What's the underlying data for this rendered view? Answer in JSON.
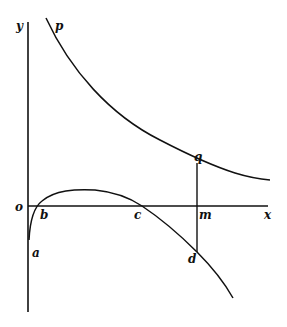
{
  "diagram": {
    "labels": {
      "y_axis": "y",
      "x_axis": "x",
      "origin": "o",
      "curve_upper": "p",
      "point_q": "q",
      "point_m": "m",
      "point_a": "a",
      "point_b": "b",
      "point_c": "c",
      "point_d": "d"
    },
    "colors": {
      "ink": "#111111",
      "background": "#ffffff"
    }
  }
}
